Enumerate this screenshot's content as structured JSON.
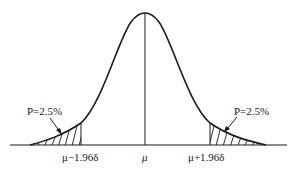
{
  "diagram": {
    "type": "normal-distribution",
    "labels": {
      "left_tail_probability": "P=2.5%",
      "right_tail_probability": "P=2.5%",
      "left_bound": "μ−1.96δ",
      "mean": "μ",
      "right_bound": "μ+1.96δ"
    },
    "colors": {
      "stroke": "#1a1a1a",
      "background": "#ffffff"
    }
  }
}
